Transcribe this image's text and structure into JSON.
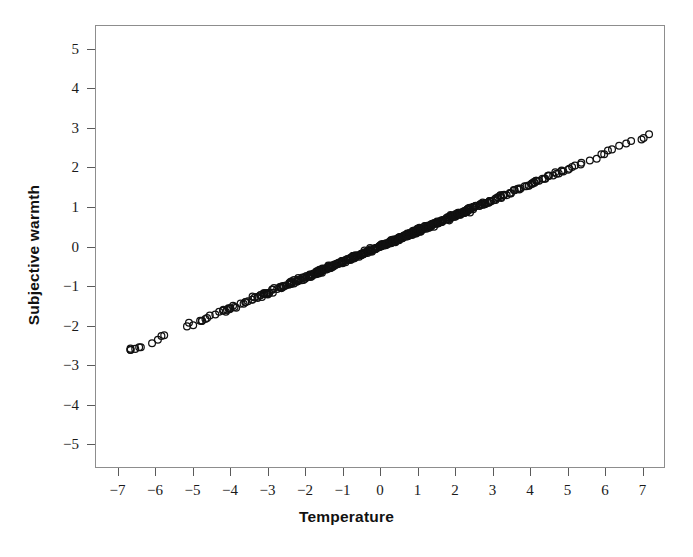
{
  "chart_data": {
    "type": "scatter",
    "title": "",
    "subtitle": "",
    "xlabel": "Temperature",
    "ylabel": "Subjective warmth",
    "xlim": [
      -7.6,
      7.6
    ],
    "ylim": [
      -5.6,
      5.6
    ],
    "xticks": [
      -7,
      -6,
      -5,
      -4,
      -3,
      -2,
      -1,
      0,
      1,
      2,
      3,
      4,
      5,
      6,
      7
    ],
    "yticks": [
      5,
      4,
      3,
      2,
      1,
      0,
      -1,
      -2,
      -3,
      -4,
      -5
    ],
    "xticklabels": [
      "−7",
      "−6",
      "−5",
      "−4",
      "−3",
      "−2",
      "−1",
      "0",
      "1",
      "2",
      "3",
      "4",
      "5",
      "6",
      "7"
    ],
    "yticklabels": [
      "5",
      "4",
      "3",
      "2",
      "1",
      "0",
      "−1",
      "−2",
      "−3",
      "−4",
      "−5"
    ],
    "grid": false,
    "legend": false,
    "marker": "open-circle",
    "marker_color": "#111111",
    "frame_color": "#8d8d8d",
    "background": "#ffffff",
    "relationship": {
      "form": "linear",
      "slope": 0.3925,
      "intercept": 0.0,
      "scatter_sd": 0.022,
      "x_min": -6.68,
      "x_max": 7.2,
      "n_points": 560,
      "note": "Near-perfect positive linear relation; heavy overplotting forms a solid band in the middle."
    },
    "notable_points": [
      {
        "x": -6.68,
        "y": -2.62
      },
      {
        "x": -6.55,
        "y": -2.6
      },
      {
        "x": -6.4,
        "y": -2.56
      },
      {
        "x": -6.1,
        "y": -2.46
      },
      {
        "x": 6.1,
        "y": 2.44
      },
      {
        "x": 6.4,
        "y": 2.56
      },
      {
        "x": 6.72,
        "y": 2.68
      },
      {
        "x": 7.2,
        "y": 2.85
      }
    ]
  }
}
